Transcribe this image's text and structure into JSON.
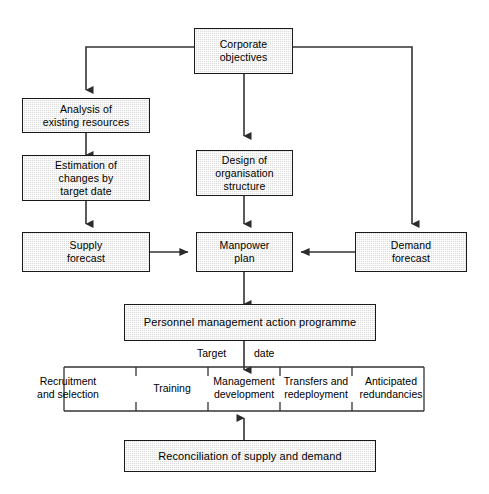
{
  "diagram": {
    "background_color": "#ffffff",
    "box_fill_color": "#dddddd",
    "box_border_color": "#1a1a1a",
    "line_color": "#333333",
    "nodes": {
      "corporate_objectives": "Corporate\nobjectives",
      "analysis_existing_resources": "Analysis of\nexisting resources",
      "estimation_changes": "Estimation of\nchanges by\ntarget date",
      "design_organisation": "Design of\norganisation\nstructure",
      "supply_forecast": "Supply\nforecast",
      "manpower_plan": "Manpower\nplan",
      "demand_forecast": "Demand\nforecast",
      "personnel_programme": "Personnel management action programme",
      "reconciliation": "Reconciliation of supply and demand"
    },
    "target_date": {
      "word_left": "Target",
      "word_right": "date"
    },
    "outcomes": [
      "Recruitment\nand selection",
      "Training",
      "Management\ndevelopment",
      "Transfers and\nredeployment",
      "Anticipated\nredundancies"
    ]
  }
}
